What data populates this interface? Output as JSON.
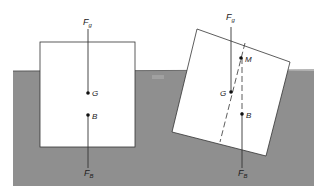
{
  "diagram": {
    "colors": {
      "background": "#ffffff",
      "water": "#8f8f8f",
      "body": "#ffffff",
      "line": "#333333"
    },
    "left_body": {
      "force_top_label": "F",
      "force_top_sub": "g",
      "force_bottom_label": "F",
      "force_bottom_sub": "B",
      "point_g": "G",
      "point_b": "B"
    },
    "right_body": {
      "force_top_label": "F",
      "force_top_sub": "g",
      "force_bottom_label": "F",
      "force_bottom_sub": "B",
      "point_g": "G",
      "point_b": "B",
      "point_m": "M"
    }
  }
}
